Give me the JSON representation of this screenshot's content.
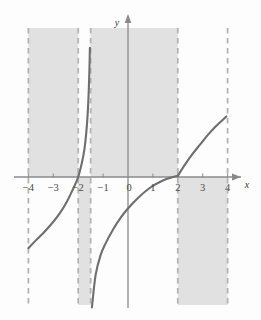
{
  "figure": {
    "title": "",
    "axis_labels": {
      "x": "x",
      "y": "y"
    },
    "colors": {
      "curve": "#6e6e6e",
      "axis": "#8a8a8a",
      "dashed": "#b4b4b4",
      "shading": "#dcdcdc",
      "text": "#4a4a4a",
      "background": "#fdfdfd"
    }
  },
  "chart_data": {
    "type": "line",
    "title": "",
    "xlabel": "x",
    "ylabel": "y",
    "xlim": [
      -4.6,
      4.6
    ],
    "ylim": [
      -5.7,
      5.7
    ],
    "grid": false,
    "legend": null,
    "x_ticks": [
      -4,
      -3,
      -2,
      -1,
      0,
      1,
      2,
      3,
      4
    ],
    "x_tick_labels": [
      "−4",
      "−3",
      "−2",
      "−1",
      "0",
      "1",
      "2",
      "3",
      "4"
    ],
    "y_ticks": [],
    "y_tick_labels": [],
    "asymptotes": [
      {
        "x": -1.5,
        "style": "dashed"
      }
    ],
    "boundary_lines": [
      {
        "x": -4,
        "style": "dashed"
      },
      {
        "x": -2,
        "style": "dashed"
      },
      {
        "x": -1.5,
        "style": "dashed"
      },
      {
        "x": 2,
        "style": "dashed"
      },
      {
        "x": 4,
        "style": "dashed"
      }
    ],
    "shaded_regions": [
      {
        "x_start": -4,
        "x_end": -2,
        "side": "above-axis",
        "label": "band-1"
      },
      {
        "x_start": -2,
        "x_end": -1.5,
        "side": "below-axis",
        "label": "band-2"
      },
      {
        "x_start": -1.5,
        "x_end": 2,
        "side": "above-axis",
        "label": "band-3"
      },
      {
        "x_start": 2,
        "x_end": 4,
        "side": "below-axis",
        "label": "band-4"
      }
    ],
    "series": [
      {
        "name": "branch-left",
        "x": [
          -4.0,
          -3.7,
          -3.4,
          -3.1,
          -2.8,
          -2.5,
          -2.2,
          -2.0,
          -1.85,
          -1.75,
          -1.68,
          -1.62,
          -1.58,
          -1.55,
          -1.53
        ],
        "y": [
          -3.05,
          -2.72,
          -2.4,
          -2.05,
          -1.65,
          -1.15,
          -0.5,
          0.0,
          0.62,
          1.2,
          1.85,
          2.7,
          3.6,
          4.6,
          5.55
        ]
      },
      {
        "name": "branch-middle",
        "x": [
          -1.45,
          -1.3,
          -1.1,
          -0.9,
          -0.6,
          -0.3,
          0.0,
          0.4,
          0.9,
          1.4,
          1.8,
          2.0
        ],
        "y": [
          -5.6,
          -4.2,
          -3.35,
          -2.85,
          -2.25,
          -1.75,
          -1.35,
          -0.9,
          -0.45,
          -0.15,
          0.0,
          0.05
        ]
      },
      {
        "name": "branch-right",
        "x": [
          2.0,
          2.3,
          2.6,
          2.9,
          3.2,
          3.5,
          3.8,
          3.95
        ],
        "y": [
          0.05,
          0.55,
          1.0,
          1.4,
          1.8,
          2.15,
          2.45,
          2.6
        ]
      }
    ]
  }
}
